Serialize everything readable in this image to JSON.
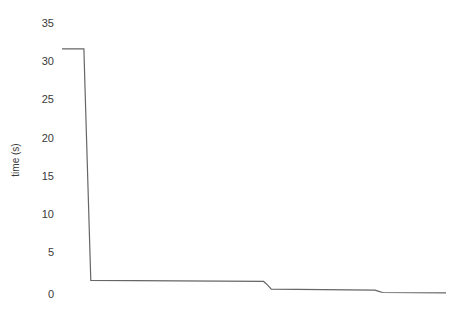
{
  "chart_data": {
    "type": "line",
    "title": "",
    "subtitle": "",
    "xlabel": "",
    "ylabel": "time (s)",
    "ylim": [
      0,
      35
    ],
    "xlim": [
      0,
      100
    ],
    "grid": false,
    "legend": null,
    "yticks": [
      0,
      5,
      10,
      15,
      20,
      25,
      30,
      35
    ],
    "ytick_labels": [
      "0",
      "5",
      "10",
      "15",
      "20",
      "25",
      "30",
      "35"
    ],
    "xticks": [],
    "xtick_labels": [],
    "line_color": "#666666",
    "line_width": 1.2,
    "series": [
      {
        "name": "time",
        "x": [
          0.0,
          5.7,
          6.0,
          7.5,
          52.5,
          53.5,
          54.5,
          81.5,
          82.5,
          83.5,
          100.0
        ],
        "values": [
          32.2,
          32.2,
          27.0,
          1.8,
          1.65,
          1.2,
          0.65,
          0.5,
          0.35,
          0.2,
          0.15
        ]
      }
    ]
  },
  "figure": {
    "background": "#ffffff",
    "plot_background": "#ffffff"
  }
}
